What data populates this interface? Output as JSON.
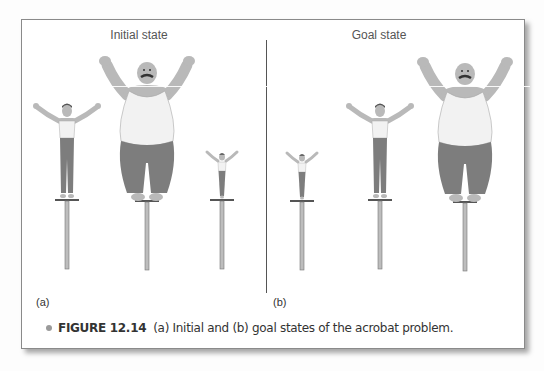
{
  "figure": {
    "panels": [
      {
        "id": "a",
        "title": "Initial state",
        "label": "(a)",
        "acrobats_left_to_right": [
          "medium",
          "large",
          "small"
        ]
      },
      {
        "id": "b",
        "title": "Goal state",
        "label": "(b)",
        "acrobats_left_to_right": [
          "small",
          "medium",
          "large"
        ]
      }
    ],
    "caption": {
      "number": "FIGURE 12.14",
      "text": "(a) Initial and (b) goal states of the acrobat problem."
    },
    "colors": {
      "frame_border": "#8a8a8a",
      "skin": "#b9b9b9",
      "pants": "#7d7d7d",
      "shirt": "#f2f2f2",
      "pole": "#9a9a9a",
      "caption_bullet": "#9a9a9a"
    }
  }
}
